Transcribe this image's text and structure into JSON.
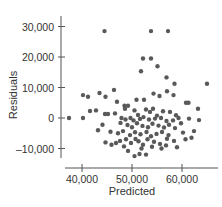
{
  "chart_data": {
    "type": "scatter",
    "title": "",
    "xlabel": "Predicted",
    "ylabel": "Residuals",
    "xlim": [
      35800,
      67000
    ],
    "ylim": [
      -15000,
      33000
    ],
    "x_ticks": [
      40000,
      50000,
      60000
    ],
    "x_tick_labels": [
      "40,000",
      "50,000",
      "60,000"
    ],
    "y_ticks": [
      -10000,
      0,
      10000,
      20000,
      30000
    ],
    "y_tick_labels": [
      "–10,000",
      "0",
      "10,000",
      "20,000",
      "30,000"
    ],
    "grid": false,
    "legend": null,
    "colors": {
      "points": "#595959",
      "axis": "#555555",
      "text": "#333333"
    },
    "points": [
      [
        44500,
        28500
      ],
      [
        53800,
        28500
      ],
      [
        57200,
        28500
      ],
      [
        52200,
        19500
      ],
      [
        53800,
        19500
      ],
      [
        51800,
        15300
      ],
      [
        55100,
        17000
      ],
      [
        56900,
        13300
      ],
      [
        58500,
        11200
      ],
      [
        65000,
        11200
      ],
      [
        40200,
        7500
      ],
      [
        41200,
        7000
      ],
      [
        43500,
        8200
      ],
      [
        44700,
        7000
      ],
      [
        47000,
        5300
      ],
      [
        46400,
        9200
      ],
      [
        48500,
        4000
      ],
      [
        49200,
        4000
      ],
      [
        50900,
        6000
      ],
      [
        52400,
        6000
      ],
      [
        54300,
        8000
      ],
      [
        55500,
        7200
      ],
      [
        57000,
        8800
      ],
      [
        58300,
        7500
      ],
      [
        60800,
        5000
      ],
      [
        61300,
        5000
      ],
      [
        63200,
        3000
      ],
      [
        41600,
        2300
      ],
      [
        42800,
        2500
      ],
      [
        44600,
        1300
      ],
      [
        45200,
        1300
      ],
      [
        46600,
        1500
      ],
      [
        48600,
        3000
      ],
      [
        50500,
        2500
      ],
      [
        51200,
        1000
      ],
      [
        52800,
        2800
      ],
      [
        53600,
        2000
      ],
      [
        54200,
        3000
      ],
      [
        55000,
        800
      ],
      [
        56200,
        2200
      ],
      [
        57600,
        2000
      ],
      [
        58800,
        900
      ],
      [
        37400,
        0
      ],
      [
        40200,
        0
      ],
      [
        47900,
        0
      ],
      [
        48700,
        -500
      ],
      [
        49700,
        0
      ],
      [
        50300,
        -800
      ],
      [
        51600,
        -300
      ],
      [
        52300,
        300
      ],
      [
        53400,
        -500
      ],
      [
        54600,
        -200
      ],
      [
        55800,
        0
      ],
      [
        56900,
        -1000
      ],
      [
        58200,
        -800
      ],
      [
        59300,
        0
      ],
      [
        61400,
        -200
      ],
      [
        63400,
        -700
      ],
      [
        44100,
        -2200
      ],
      [
        47700,
        -1600
      ],
      [
        49100,
        -2300
      ],
      [
        50000,
        -3000
      ],
      [
        51000,
        -1700
      ],
      [
        52100,
        -2600
      ],
      [
        53200,
        -3000
      ],
      [
        54100,
        -1900
      ],
      [
        55300,
        -2500
      ],
      [
        56400,
        -3100
      ],
      [
        57400,
        -2200
      ],
      [
        58600,
        -3300
      ],
      [
        59800,
        -1700
      ],
      [
        43200,
        -4000
      ],
      [
        45700,
        -4500
      ],
      [
        47200,
        -5000
      ],
      [
        48200,
        -4300
      ],
      [
        49600,
        -5600
      ],
      [
        50600,
        -4700
      ],
      [
        51700,
        -5300
      ],
      [
        52900,
        -4600
      ],
      [
        53800,
        -6000
      ],
      [
        54900,
        -5200
      ],
      [
        56000,
        -4600
      ],
      [
        57300,
        -5600
      ],
      [
        60200,
        -4800
      ],
      [
        62400,
        -4300
      ],
      [
        44700,
        -8000
      ],
      [
        45900,
        -8800
      ],
      [
        46800,
        -8200
      ],
      [
        47600,
        -7500
      ],
      [
        48800,
        -7000
      ],
      [
        49800,
        -8200
      ],
      [
        50700,
        -6900
      ],
      [
        51300,
        -7600
      ],
      [
        52200,
        -8800
      ],
      [
        53100,
        -7000
      ],
      [
        54400,
        -7800
      ],
      [
        55600,
        -8500
      ],
      [
        57000,
        -6800
      ],
      [
        58400,
        -7500
      ],
      [
        60700,
        -7000
      ],
      [
        61900,
        -6500
      ],
      [
        49200,
        -10800
      ],
      [
        50500,
        -12500
      ],
      [
        51500,
        -11800
      ],
      [
        52800,
        -12000
      ],
      [
        55900,
        -10000
      ],
      [
        59000,
        -9600
      ],
      [
        48400,
        -9300
      ],
      [
        51900,
        -10000
      ],
      [
        54000,
        -9400
      ],
      [
        56800,
        -9000
      ]
    ]
  }
}
